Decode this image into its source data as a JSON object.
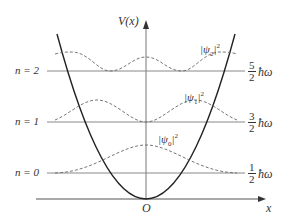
{
  "axes": {
    "y_label": "V(x)",
    "x_label": "x",
    "origin_label": "O"
  },
  "levels": [
    {
      "n_label": "n = 0",
      "num": "1",
      "den": "2",
      "unit": "ħω",
      "psi_label": "ψ",
      "psi_sub": "0",
      "psi_sup": "2"
    },
    {
      "n_label": "n = 1",
      "num": "3",
      "den": "2",
      "unit": "ħω",
      "psi_label": "ψ",
      "psi_sub": "1",
      "psi_sup": "2"
    },
    {
      "n_label": "n = 2",
      "num": "5",
      "den": "2",
      "unit": "ħω",
      "psi_label": "ψ",
      "psi_sub": "2",
      "psi_sup": "2"
    }
  ],
  "colors": {
    "ink": "#333333",
    "grid": "#888888"
  }
}
